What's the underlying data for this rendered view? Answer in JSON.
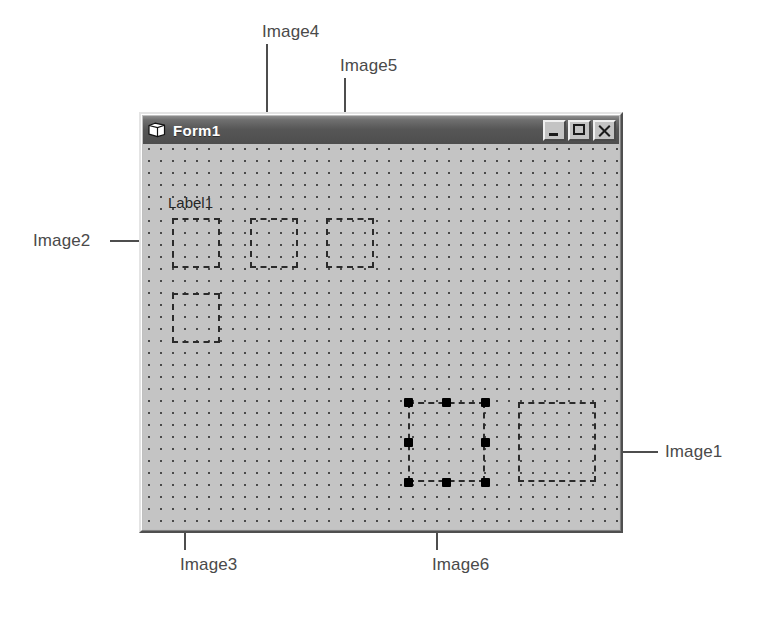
{
  "figure": {
    "background_color": "#ffffff",
    "callout_color": "#4d4d4d"
  },
  "window": {
    "title": "Form1",
    "icon": "form-document-icon",
    "titlebar_color": "#565656",
    "face_color": "#c0c0c0",
    "controls": [
      {
        "name": "minimize",
        "label": "_",
        "icon": "minimize-icon"
      },
      {
        "name": "maximize",
        "label": "□",
        "icon": "maximize-icon"
      },
      {
        "name": "close",
        "label": "×",
        "icon": "close-icon"
      }
    ]
  },
  "form": {
    "label_caption": "Label1",
    "grid": {
      "dot_spacing_px": 12,
      "dot_color": "#4a4a4a",
      "canvas_color": "#c4c4c4"
    },
    "controls": [
      {
        "id": "Image2",
        "selected": false,
        "x": 29,
        "y": 74,
        "w": 48,
        "h": 50
      },
      {
        "id": "Image4",
        "selected": false,
        "x": 107,
        "y": 74,
        "w": 48,
        "h": 50
      },
      {
        "id": "Image5",
        "selected": false,
        "x": 183,
        "y": 74,
        "w": 48,
        "h": 50
      },
      {
        "id": "Image3",
        "selected": false,
        "x": 29,
        "y": 149,
        "w": 48,
        "h": 50
      },
      {
        "id": "Image6",
        "selected": true,
        "x": 265,
        "y": 258,
        "w": 77,
        "h": 80
      },
      {
        "id": "Image1",
        "selected": false,
        "x": 375,
        "y": 258,
        "w": 78,
        "h": 80
      }
    ],
    "selection_handle_count": 8
  },
  "annotations": [
    {
      "id": "Image1",
      "label": "Image1",
      "side": "right"
    },
    {
      "id": "Image2",
      "label": "Image2",
      "side": "left"
    },
    {
      "id": "Image3",
      "label": "Image3",
      "side": "bottom"
    },
    {
      "id": "Image4",
      "label": "Image4",
      "side": "top"
    },
    {
      "id": "Image5",
      "label": "Image5",
      "side": "top"
    },
    {
      "id": "Image6",
      "label": "Image6",
      "side": "bottom"
    }
  ]
}
